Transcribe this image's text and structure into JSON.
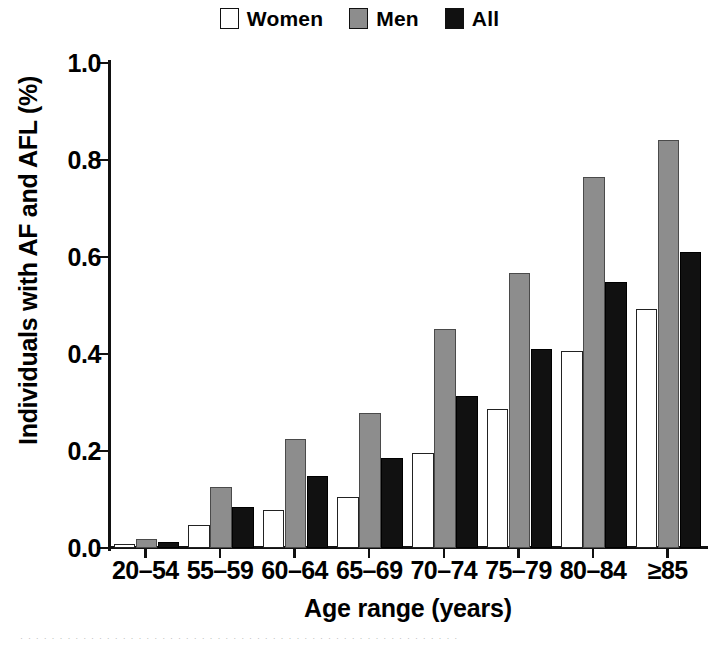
{
  "legend": {
    "entries": [
      {
        "label": "Women",
        "swatch": "white-square-icon",
        "color": "#ffffff"
      },
      {
        "label": "Men",
        "swatch": "gray-square-icon",
        "color": "#8d8d8d"
      },
      {
        "label": "All",
        "swatch": "black-square-icon",
        "color": "#111111"
      }
    ]
  },
  "axes": {
    "y_title": "Individuals with AF and AFL (%)",
    "x_title": "Age range (years)",
    "y_ticks": [
      "0.0",
      "0.2",
      "0.4",
      "0.6",
      "0.8",
      "1.0"
    ]
  },
  "chart_data": {
    "type": "bar",
    "title": "",
    "xlabel": "Age range (years)",
    "ylabel": "Individuals with AF and AFL (%)",
    "ylim": [
      0.0,
      1.0
    ],
    "ytick_values": [
      0.0,
      0.2,
      0.4,
      0.6,
      0.8,
      1.0
    ],
    "grid": false,
    "legend_position": "top-center",
    "categories": [
      "20–54",
      "55–59",
      "60–64",
      "65–69",
      "70–74",
      "75–79",
      "80–84",
      "≥85"
    ],
    "series": [
      {
        "name": "Women",
        "color": "#ffffff",
        "values": [
          0.008,
          0.048,
          0.079,
          0.106,
          0.196,
          0.287,
          0.407,
          0.492
        ]
      },
      {
        "name": "Men",
        "color": "#8d8d8d",
        "values": [
          0.019,
          0.126,
          0.224,
          0.278,
          0.452,
          0.568,
          0.766,
          0.841
        ]
      },
      {
        "name": "All",
        "color": "#111111",
        "values": [
          0.012,
          0.085,
          0.149,
          0.186,
          0.313,
          0.41,
          0.549,
          0.61
        ]
      }
    ]
  },
  "caption_strip": "· · · · · · · · · · · · · · · · · · · · · · · · · · · · · · · · · · · · · · · · · · · · · · · · · · · · · · · ·"
}
